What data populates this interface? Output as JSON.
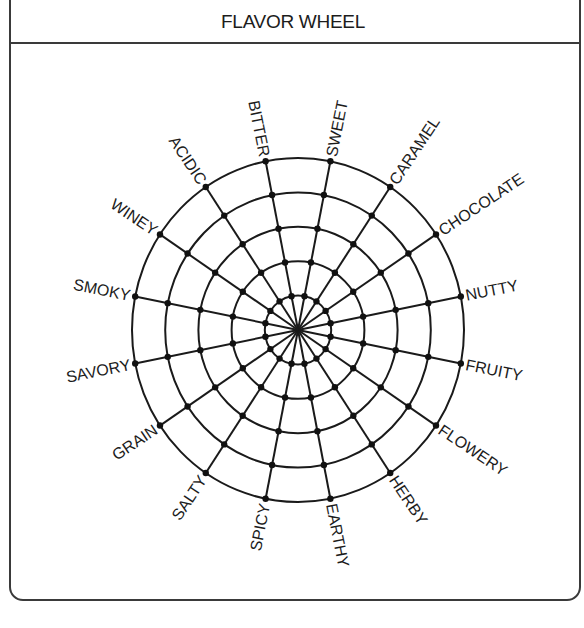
{
  "header": {
    "title": "FLAVOR WHEEL"
  },
  "wheel": {
    "center": {
      "x": 298,
      "y": 330
    },
    "radius_x": 166,
    "radius_y": 172,
    "ring_count": 5,
    "start_angle_deg": -101.25,
    "step_angle_deg": 22.5,
    "line_color": "#1a1a1a",
    "labels": [
      "BITTER",
      "SWEET",
      "CARAMEL",
      "CHOCOLATE",
      "NUTTY",
      "FRUITY",
      "FLOWERY",
      "HERBY",
      "EARTHY",
      "SPICY",
      "SALTY",
      "GRAIN",
      "SAVORY",
      "SMOKY",
      "WINEY",
      "ACIDIC"
    ]
  }
}
